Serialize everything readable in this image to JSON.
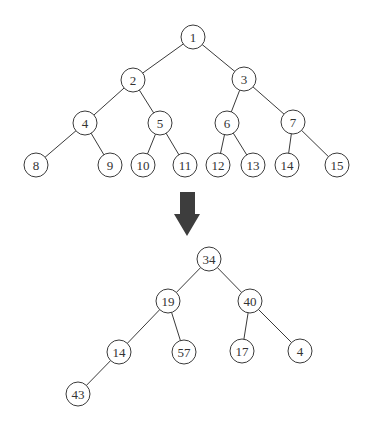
{
  "diagram": {
    "node_radius": 12,
    "colors": {
      "stroke": "#3a3a3a",
      "text": "#333333",
      "arrow": "#3d3d3d",
      "background": "#ffffff"
    },
    "top_tree": {
      "nodes": [
        {
          "id": "t1",
          "label": "1",
          "x": 193,
          "y": 37
        },
        {
          "id": "t2",
          "label": "2",
          "x": 133,
          "y": 80
        },
        {
          "id": "t3",
          "label": "3",
          "x": 244,
          "y": 79
        },
        {
          "id": "t4",
          "label": "4",
          "x": 85,
          "y": 123
        },
        {
          "id": "t5",
          "label": "5",
          "x": 160,
          "y": 123
        },
        {
          "id": "t6",
          "label": "6",
          "x": 227,
          "y": 123
        },
        {
          "id": "t7",
          "label": "7",
          "x": 293,
          "y": 122
        },
        {
          "id": "t8",
          "label": "8",
          "x": 36,
          "y": 165
        },
        {
          "id": "t9",
          "label": "9",
          "x": 110,
          "y": 165
        },
        {
          "id": "t10",
          "label": "10",
          "x": 143,
          "y": 165
        },
        {
          "id": "t11",
          "label": "11",
          "x": 185,
          "y": 165
        },
        {
          "id": "t12",
          "label": "12",
          "x": 218,
          "y": 165
        },
        {
          "id": "t13",
          "label": "13",
          "x": 253,
          "y": 165
        },
        {
          "id": "t14",
          "label": "14",
          "x": 287,
          "y": 165
        },
        {
          "id": "t15",
          "label": "15",
          "x": 337,
          "y": 165
        }
      ],
      "edges": [
        [
          "t1",
          "t2"
        ],
        [
          "t1",
          "t3"
        ],
        [
          "t2",
          "t4"
        ],
        [
          "t2",
          "t5"
        ],
        [
          "t3",
          "t6"
        ],
        [
          "t3",
          "t7"
        ],
        [
          "t4",
          "t8"
        ],
        [
          "t4",
          "t9"
        ],
        [
          "t5",
          "t10"
        ],
        [
          "t5",
          "t11"
        ],
        [
          "t6",
          "t12"
        ],
        [
          "t6",
          "t13"
        ],
        [
          "t7",
          "t14"
        ],
        [
          "t7",
          "t15"
        ]
      ]
    },
    "arrow": {
      "direction": "down",
      "shaft": {
        "x1": 180,
        "x2": 195,
        "y1": 192,
        "y2": 214
      },
      "head": {
        "x1": 174,
        "x2": 200,
        "y": 214,
        "tip_x": 187,
        "tip_y": 236
      }
    },
    "bottom_tree": {
      "nodes": [
        {
          "id": "b34",
          "label": "34",
          "x": 209,
          "y": 259
        },
        {
          "id": "b19",
          "label": "19",
          "x": 168,
          "y": 301
        },
        {
          "id": "b40",
          "label": "40",
          "x": 250,
          "y": 301
        },
        {
          "id": "b14",
          "label": "14",
          "x": 119,
          "y": 352
        },
        {
          "id": "b57",
          "label": "57",
          "x": 184,
          "y": 352
        },
        {
          "id": "b17",
          "label": "17",
          "x": 242,
          "y": 351
        },
        {
          "id": "b4",
          "label": "4",
          "x": 300,
          "y": 351
        },
        {
          "id": "b43",
          "label": "43",
          "x": 78,
          "y": 394
        }
      ],
      "edges": [
        [
          "b34",
          "b19"
        ],
        [
          "b34",
          "b40"
        ],
        [
          "b19",
          "b14"
        ],
        [
          "b19",
          "b57"
        ],
        [
          "b40",
          "b17"
        ],
        [
          "b40",
          "b4"
        ],
        [
          "b14",
          "b43"
        ]
      ]
    }
  }
}
